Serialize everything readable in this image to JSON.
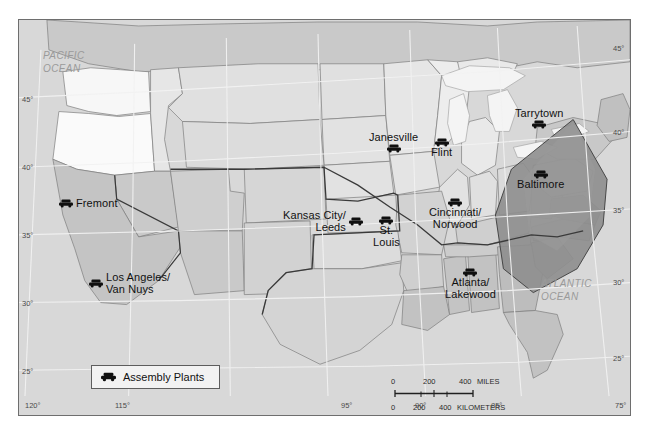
{
  "figure": {
    "title": "Assembly Plants",
    "kind": "thematic-map",
    "region": "United States"
  },
  "plants": [
    {
      "name": "Fremont",
      "label": "Fremont",
      "x": 56,
      "y": 185,
      "layout": "side"
    },
    {
      "name": "los-angeles-van-nuys",
      "label": "Los Angeles/\nVan Nuys",
      "x": 90,
      "y": 264,
      "layout": "side"
    },
    {
      "name": "kansas-city-leeds",
      "label": "Kansas City/\nLeeds",
      "x": 345,
      "y": 192,
      "layout": "side-left"
    },
    {
      "name": "st-louis",
      "label": "St.\nLouis",
      "x": 385,
      "y": 203,
      "layout": "stack"
    },
    {
      "name": "janesville",
      "label": "Janesville",
      "x": 419,
      "y": 140,
      "layout": "stack-above"
    },
    {
      "name": "flint",
      "label": "Flint",
      "x": 456,
      "y": 139,
      "layout": "stack-side"
    },
    {
      "name": "cincinnati-norwood",
      "label": "Cincinnati/\nNorwood",
      "x": 470,
      "y": 201,
      "layout": "stack"
    },
    {
      "name": "tarrytown",
      "label": "Tarrytown",
      "x": 558,
      "y": 114,
      "layout": "stack-above"
    },
    {
      "name": "baltimore",
      "label": "Baltimore",
      "x": 548,
      "y": 174,
      "layout": "stack"
    },
    {
      "name": "atlanta-lakewood",
      "label": "Atlanta/\nLakewood",
      "x": 478,
      "y": 272,
      "layout": "stack"
    }
  ],
  "ocean_labels": [
    {
      "name": "pacific-ocean",
      "text": "PACIFIC\nOCEAN",
      "x": 24,
      "y": 30
    },
    {
      "name": "atlantic-ocean",
      "text": "ATLANTIC\nOCEAN",
      "x": 540,
      "y": 268
    }
  ],
  "graticule": {
    "latitude_left": [
      {
        "label": "45°",
        "y": 84
      },
      {
        "label": "40°",
        "y": 150
      },
      {
        "label": "35°",
        "y": 217
      },
      {
        "label": "30°",
        "y": 283
      },
      {
        "label": "25°",
        "y": 350
      }
    ],
    "latitude_right": [
      {
        "label": "45°",
        "y": 28
      },
      {
        "label": "40°",
        "y": 114
      },
      {
        "label": "35°",
        "y": 193
      },
      {
        "label": "30°",
        "y": 265
      },
      {
        "label": "25°",
        "y": 340
      }
    ],
    "longitude_bottom": [
      {
        "label": "120°",
        "x": 23
      },
      {
        "label": "115°",
        "x": 113
      },
      {
        "label": "95°",
        "x": 338
      },
      {
        "label": "90°",
        "x": 413
      },
      {
        "label": "85°",
        "x": 490
      },
      {
        "label": "75°",
        "x": 628
      }
    ]
  },
  "legend": {
    "icon": "car-icon",
    "label": "Assembly Plants"
  },
  "scale_bar": {
    "miles": {
      "units": "MILES",
      "ticks": [
        {
          "label": "0",
          "x": 0
        },
        {
          "label": "200",
          "x": 36
        },
        {
          "label": "400",
          "x": 74
        }
      ],
      "unit_label_x": 91
    },
    "kilometers": {
      "units": "KILOMETERS",
      "ticks": [
        {
          "label": "0",
          "x": 0
        },
        {
          "label": "200",
          "x": 26
        },
        {
          "label": "400",
          "x": 55
        }
      ],
      "unit_label_x": 71
    }
  },
  "colors": {
    "frame_border": "#6e6e6e",
    "ocean": "#d8d8d8",
    "land_light": "#f4f4f4",
    "land_mid": "#e2e2e2",
    "land_gray": "#c6c6c6",
    "land_dark": "#9d9d9d",
    "wedge_dark": "#8f8f8f",
    "boundary": "#7d7d7d",
    "heavy_boundary": "#3a3a3a",
    "graticule": "#f0f0f0",
    "text": "#111111",
    "ocean_text": "#9a9a9a",
    "legend_bg": "#f2f2f2"
  }
}
